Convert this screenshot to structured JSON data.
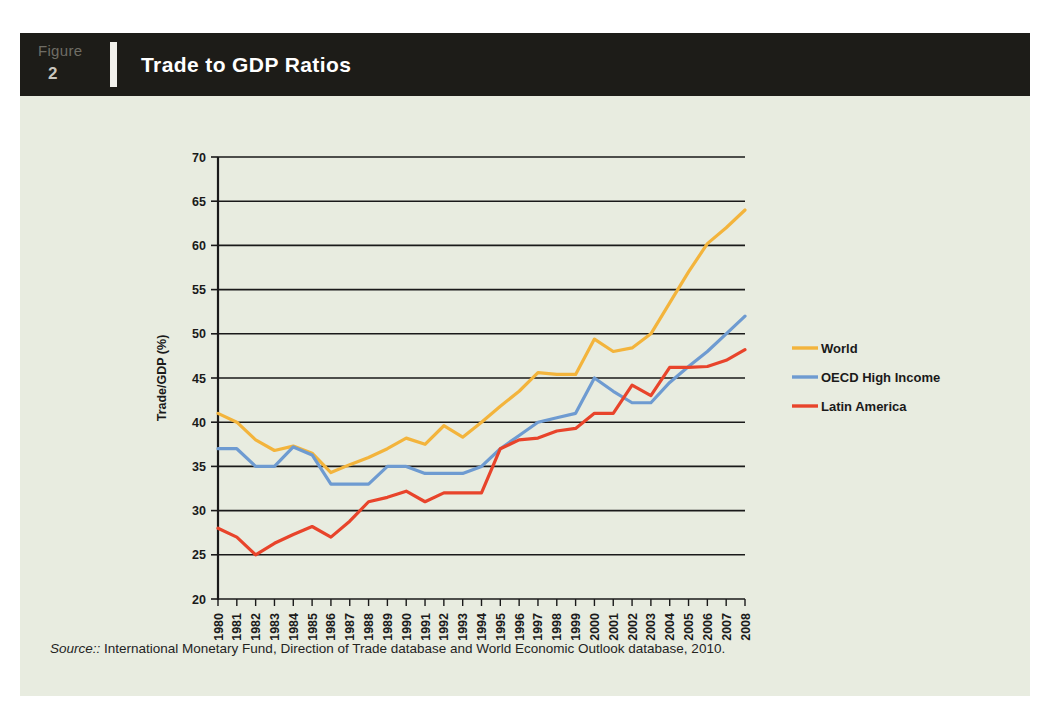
{
  "figure": {
    "label_word": "Figure",
    "number": "2",
    "title": "Trade to GDP Ratios"
  },
  "source": {
    "prefix": "Source::",
    "text": " International Monetary Fund, Direction of Trade database and World Economic Outlook database, 2010."
  },
  "colors": {
    "panel_background": "#e8ece0",
    "header_background": "#1d1c18",
    "header_title_color": "#ffffff",
    "figure_word_color": "#6f6d65",
    "world": "#f3b43c",
    "oecd": "#6e9bd1",
    "latin_america": "#e8442b",
    "gridline": "#1a1a1a",
    "axis": "#1a1a1a"
  },
  "chart_data": {
    "type": "line",
    "title": "Trade to GDP Ratios",
    "xlabel": "",
    "ylabel": "Trade/GDP (%)",
    "ylim": [
      20,
      70
    ],
    "ytick_step": 5,
    "yticks": [
      20,
      25,
      30,
      35,
      40,
      45,
      50,
      55,
      60,
      65,
      70
    ],
    "grid": true,
    "legend_position": "right",
    "categories": [
      "1980",
      "1981",
      "1982",
      "1983",
      "1984",
      "1985",
      "1986",
      "1987",
      "1988",
      "1989",
      "1990",
      "1991",
      "1992",
      "1993",
      "1994",
      "1995",
      "1996",
      "1997",
      "1998",
      "1999",
      "2000",
      "2001",
      "2002",
      "2003",
      "2004",
      "2005",
      "2006",
      "2007",
      "2008"
    ],
    "series": [
      {
        "name": "World",
        "color": "#f3b43c",
        "values": [
          41.0,
          40.0,
          38.0,
          36.8,
          37.3,
          36.5,
          34.3,
          35.2,
          36.0,
          37.0,
          38.2,
          37.5,
          39.6,
          38.3,
          40.0,
          41.8,
          43.5,
          45.6,
          45.4,
          45.4,
          49.4,
          48.0,
          48.4,
          50.0,
          53.5,
          57.0,
          60.2,
          62.0,
          64.0
        ]
      },
      {
        "name": "OECD High Income",
        "color": "#6e9bd1",
        "values": [
          37.0,
          37.0,
          35.0,
          35.0,
          37.2,
          36.3,
          33.0,
          33.0,
          33.0,
          35.0,
          35.0,
          34.2,
          34.2,
          34.2,
          35.0,
          37.0,
          38.5,
          40.0,
          40.5,
          41.0,
          45.0,
          43.5,
          42.2,
          42.2,
          44.5,
          46.3,
          48.0,
          50.0,
          52.0
        ]
      },
      {
        "name": "Latin America",
        "color": "#e8442b",
        "values": [
          28.0,
          27.0,
          25.0,
          26.3,
          27.3,
          28.2,
          27.0,
          28.8,
          31.0,
          31.5,
          32.2,
          31.0,
          32.0,
          32.0,
          32.0,
          37.0,
          38.0,
          38.2,
          39.0,
          39.3,
          41.0,
          41.0,
          44.2,
          43.0,
          46.2,
          46.2,
          46.3,
          47.0,
          48.2
        ]
      }
    ]
  }
}
